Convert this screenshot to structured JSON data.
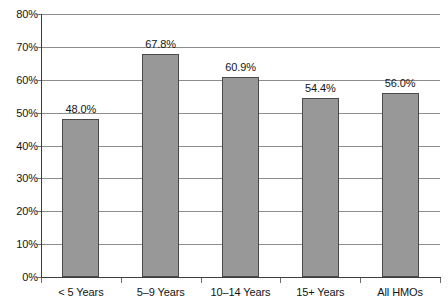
{
  "chart_data": {
    "type": "bar",
    "title": "",
    "subtitle": "",
    "xlabel": "",
    "ylabel": "",
    "categories": [
      "< 5 Years",
      "5–9 Years",
      "10–14 Years",
      "15+ Years",
      "All HMOs"
    ],
    "values": [
      48.0,
      67.8,
      60.9,
      54.4,
      56.0
    ],
    "value_labels": [
      "48.0%",
      "67.8%",
      "60.9%",
      "54.4%",
      "56.0%"
    ],
    "ylim": [
      0,
      80
    ],
    "ytick_values": [
      0,
      10,
      20,
      30,
      40,
      50,
      60,
      70,
      80
    ],
    "ytick_labels": [
      "0%",
      "10%",
      "20%",
      "30%",
      "40%",
      "50%",
      "60%",
      "70%",
      "80%"
    ],
    "grid": true,
    "grid_axis": "y",
    "legend": false,
    "legend_position": "none",
    "bar_color": "#989898",
    "bar_edge_color": "#4a4a4a",
    "grid_color": "#8c8c8c",
    "axis_color": "#3c3c3c",
    "text_color": "#141414",
    "background_color": "#ffffff"
  }
}
